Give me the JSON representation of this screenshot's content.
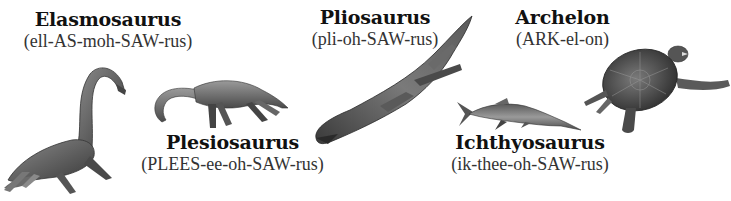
{
  "figure": {
    "labels": [
      {
        "id": "elasmosaurus",
        "name": "Elasmosaurus",
        "pronunciation": "(ell-AS-moh-SAW-rus)"
      },
      {
        "id": "pliosaurus",
        "name": "Pliosaurus",
        "pronunciation": "(pli-oh-SAW-rus)"
      },
      {
        "id": "archelon",
        "name": "Archelon",
        "pronunciation": "(ARK-el-on)"
      },
      {
        "id": "plesiosaurus",
        "name": "Plesiosaurus",
        "pronunciation": "(PLEES-ee-oh-SAW-rus)"
      },
      {
        "id": "ichthyosaurus",
        "name": "Ichthyosaurus",
        "pronunciation": "(ik-thee-oh-SAW-rus)"
      }
    ],
    "illustrations": [
      {
        "id": "elasmosaurus",
        "icon": "long-neck-plesiosaur-illustration"
      },
      {
        "id": "plesiosaurus",
        "icon": "plesiosaur-illustration"
      },
      {
        "id": "pliosaurus",
        "icon": "pliosaur-illustration"
      },
      {
        "id": "ichthyosaurus",
        "icon": "ichthyosaur-illustration"
      },
      {
        "id": "archelon",
        "icon": "sea-turtle-illustration"
      }
    ],
    "colors": {
      "background": "#ffffff",
      "text": "#111111",
      "illustration_dark": "#3a3a3a",
      "illustration_mid": "#7a7a7a",
      "illustration_light": "#b5b5b5"
    }
  }
}
